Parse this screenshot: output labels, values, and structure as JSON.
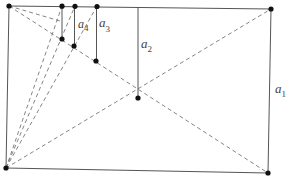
{
  "diagram": {
    "colors": {
      "solid": "#555555",
      "dashed": "#777777",
      "dot": "#111111",
      "background": "#ffffff"
    },
    "points": {
      "TL": [
        9,
        6
      ],
      "TR": [
        271,
        9
      ],
      "BR": [
        268,
        173
      ],
      "BL": [
        6,
        168
      ],
      "C": [
        138,
        98
      ],
      "T2": [
        97,
        6
      ],
      "P2": [
        96,
        61
      ],
      "T3": [
        75,
        6
      ],
      "P3": [
        74,
        46
      ],
      "T4": [
        62,
        6
      ],
      "P4": [
        62,
        39
      ]
    },
    "labels": [
      {
        "id": "a1",
        "base": "a",
        "sub": "1",
        "x": 275,
        "y": 93
      },
      {
        "id": "a2",
        "base": "a",
        "sub": "2",
        "x": 141,
        "y": 48
      },
      {
        "id": "a3",
        "base": "a",
        "sub": "3",
        "x": 99,
        "y": 27
      },
      {
        "id": "a4",
        "base": "a",
        "sub": "4",
        "x": 78,
        "y": 28
      }
    ]
  }
}
